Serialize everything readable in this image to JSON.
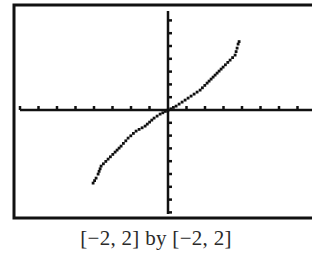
{
  "chart_data": {
    "type": "line",
    "title": "",
    "caption": "[−2, 2] by [−2, 2]",
    "xlabel": "",
    "ylabel": "",
    "xlim": [
      -2,
      2
    ],
    "ylim": [
      -2,
      2
    ],
    "grid": false,
    "legend": null,
    "tick_spacing_x": 0.25,
    "tick_spacing_y": 0.25,
    "series": [
      {
        "name": "y = arcsin(x)",
        "x": [
          -0.97,
          -0.9,
          -0.85,
          -0.6,
          -0.4,
          -0.18,
          0,
          0.18,
          0.41,
          0.6,
          0.86,
          0.89,
          0.92
        ],
        "y": [
          -1.36,
          -1.21,
          -1.03,
          -0.65,
          -0.37,
          -0.15,
          0,
          0.15,
          0.37,
          0.65,
          1.03,
          1.21,
          1.31
        ]
      }
    ]
  },
  "colors": {
    "ink": "#111111",
    "background": "#ffffff"
  },
  "pixel_curve": [
    [
      93,
      183
    ],
    [
      96,
      178
    ],
    [
      98,
      174
    ],
    [
      101,
      166
    ],
    [
      108,
      159
    ],
    [
      115,
      152
    ],
    [
      121,
      146
    ],
    [
      128,
      138
    ],
    [
      136,
      131
    ],
    [
      145,
      126
    ],
    [
      154,
      118
    ],
    [
      160,
      114
    ],
    [
      168,
      110
    ],
    [
      176,
      106
    ],
    [
      182,
      102
    ],
    [
      191,
      96
    ],
    [
      200,
      90
    ],
    [
      207,
      83
    ],
    [
      215,
      75
    ],
    [
      223,
      67
    ],
    [
      230,
      60
    ],
    [
      235,
      55
    ],
    [
      237,
      48
    ],
    [
      238,
      44
    ],
    [
      240,
      39
    ]
  ]
}
